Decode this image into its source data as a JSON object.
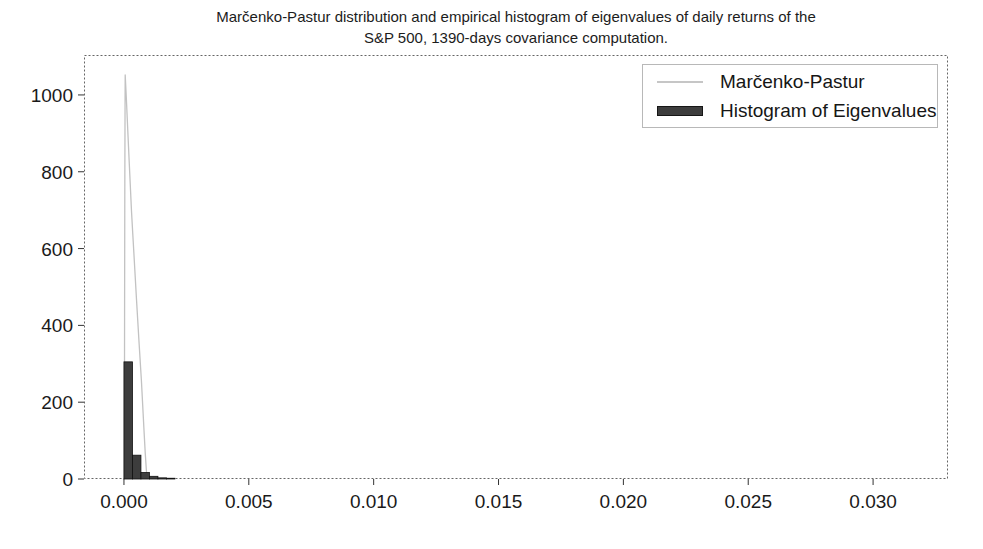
{
  "title": {
    "line1": "Marčenko-Pastur distribution and empirical histogram of eigenvalues of daily returns of the",
    "line2": "S&P 500, 1390-days covariance computation."
  },
  "legend": {
    "position": "upper right",
    "entries": [
      {
        "label": "Marčenko-Pastur",
        "type": "line",
        "color": "#c6c6c6"
      },
      {
        "label": "Histogram of Eigenvalues",
        "type": "patch",
        "color": "#3d3d3d",
        "edge_color": "#161616"
      }
    ]
  },
  "colors": {
    "background": "#ffffff",
    "frame": "#666666",
    "tick": "#333333",
    "tick_label": "#1a1a1a",
    "mp_line": "#c2c2c2",
    "histogram_fill": "#3d3d3d",
    "histogram_edge": "#111111"
  },
  "chart_data": {
    "type": "line",
    "title": "Marčenko-Pastur distribution and empirical histogram of eigenvalues of daily returns of the S&P 500, 1390-days covariance computation.",
    "xlabel": "",
    "ylabel": "",
    "grid": false,
    "legend_position": "upper right",
    "xlim": [
      -0.0016,
      0.033
    ],
    "ylim": [
      0,
      1104
    ],
    "xticks": {
      "values": [
        0.0,
        0.005,
        0.01,
        0.015,
        0.02,
        0.025,
        0.03
      ],
      "labels": [
        "0.000",
        "0.005",
        "0.010",
        "0.015",
        "0.020",
        "0.025",
        "0.030"
      ]
    },
    "yticks": {
      "values": [
        0,
        200,
        400,
        600,
        800,
        1000
      ],
      "labels": [
        "0",
        "200",
        "400",
        "600",
        "800",
        "1000"
      ]
    },
    "series": [
      {
        "name": "Marčenko-Pastur",
        "kind": "line",
        "color": "#c2c2c2",
        "points": [
          [
            1.5e-05,
            0
          ],
          [
            2.5e-05,
            420
          ],
          [
            3.5e-05,
            780
          ],
          [
            4.5e-05,
            990
          ],
          [
            5e-05,
            1052
          ],
          [
            0.0001,
            985
          ],
          [
            0.00015,
            912
          ],
          [
            0.0002,
            840
          ],
          [
            0.00025,
            770
          ],
          [
            0.0003,
            700
          ],
          [
            0.00035,
            642
          ],
          [
            0.0004,
            585
          ],
          [
            0.0005,
            470
          ],
          [
            0.0006,
            360
          ],
          [
            0.0007,
            255
          ],
          [
            0.0008,
            130
          ],
          [
            0.00085,
            70
          ],
          [
            0.0009,
            20
          ],
          [
            0.00092,
            0
          ]
        ]
      },
      {
        "name": "Histogram of Eigenvalues",
        "kind": "bar",
        "fill": "#3d3d3d",
        "edge": "#111111",
        "bins": [
          {
            "x0": 0.0,
            "x1": 0.00034,
            "count": 305
          },
          {
            "x0": 0.00034,
            "x1": 0.00068,
            "count": 62
          },
          {
            "x0": 0.00068,
            "x1": 0.00102,
            "count": 17
          },
          {
            "x0": 0.00102,
            "x1": 0.00136,
            "count": 7
          },
          {
            "x0": 0.00136,
            "x1": 0.0017,
            "count": 3
          },
          {
            "x0": 0.0017,
            "x1": 0.00204,
            "count": 2
          }
        ]
      }
    ]
  }
}
